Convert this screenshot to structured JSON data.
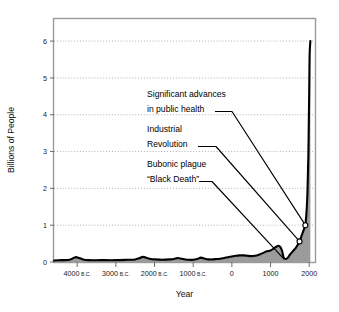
{
  "chart_data": {
    "type": "area",
    "title": "",
    "xlabel": "Year",
    "ylabel": "Billions of People",
    "xlim": [
      -4600,
      2150
    ],
    "ylim": [
      0,
      6.6
    ],
    "grid": true,
    "legend": "none",
    "x_tick_values": [
      -4000,
      -3000,
      -2000,
      -1000,
      0,
      1000,
      2000
    ],
    "x_tick_labels": [
      "4000 B.C.",
      "3000 B.C.",
      "2000 B.C.",
      "1000 B.C.",
      "0",
      "1000",
      "2000"
    ],
    "x_tick_numbers": [
      "4000",
      "3000",
      "2000",
      "1000",
      "0",
      "1000",
      "2000"
    ],
    "x_tick_eras": [
      "B.C.",
      "B.C.",
      "B.C.",
      "B.C.",
      "",
      "",
      ""
    ],
    "y_tick_values": [
      0,
      1,
      2,
      3,
      4,
      5,
      6
    ],
    "y_tick_labels": [
      "0",
      "1",
      "2",
      "3",
      "4",
      "5",
      "6"
    ],
    "series": [
      {
        "name": "World population",
        "x": [
          -4600,
          -4400,
          -4200,
          -4050,
          -3950,
          -3850,
          -3700,
          -3400,
          -3000,
          -2700,
          -2500,
          -2400,
          -2300,
          -2200,
          -2100,
          -2000,
          -1800,
          -1600,
          -1500,
          -1400,
          -1300,
          -1200,
          -1100,
          -1000,
          -900,
          -800,
          -700,
          -600,
          -500,
          -400,
          -300,
          -200,
          -100,
          0,
          100,
          200,
          300,
          400,
          500,
          600,
          700,
          800,
          900,
          1000,
          1100,
          1200,
          1250,
          1300,
          1340,
          1400,
          1450,
          1500,
          1550,
          1600,
          1650,
          1700,
          1750,
          1800,
          1850,
          1900,
          1930,
          1950,
          1960,
          1970,
          1975,
          1980,
          1990,
          2000,
          2010,
          2030
        ],
        "y": [
          0.04,
          0.05,
          0.06,
          0.13,
          0.11,
          0.07,
          0.05,
          0.05,
          0.05,
          0.06,
          0.07,
          0.1,
          0.14,
          0.11,
          0.08,
          0.07,
          0.06,
          0.07,
          0.08,
          0.11,
          0.09,
          0.07,
          0.06,
          0.06,
          0.08,
          0.12,
          0.09,
          0.07,
          0.07,
          0.08,
          0.09,
          0.11,
          0.13,
          0.15,
          0.17,
          0.18,
          0.18,
          0.17,
          0.16,
          0.17,
          0.2,
          0.24,
          0.29,
          0.31,
          0.38,
          0.44,
          0.41,
          0.3,
          0.12,
          0.08,
          0.12,
          0.2,
          0.26,
          0.32,
          0.38,
          0.46,
          0.56,
          0.7,
          0.85,
          1.0,
          1.35,
          1.75,
          2.1,
          2.55,
          2.75,
          3.0,
          3.8,
          4.6,
          5.6,
          6.0
        ]
      }
    ],
    "markers": [
      {
        "x": 1750,
        "y": 0.56,
        "label": "Industrial Revolution marker"
      },
      {
        "x": 1900,
        "y": 1.0,
        "label": "Significant advances in public health marker"
      }
    ],
    "annotations": [
      {
        "id": "public-health",
        "lines": [
          "Significant advances",
          "in public health"
        ],
        "target_x": 1900,
        "target_y": 1.0
      },
      {
        "id": "industrial-revolution",
        "lines": [
          "Industrial",
          "Revolution"
        ],
        "target_x": 1750,
        "target_y": 0.56
      },
      {
        "id": "bubonic-plague",
        "lines": [
          "Bubonic plague",
          "“Black Death”"
        ],
        "target_x": 1350,
        "target_y": 0.08
      }
    ],
    "colors": {
      "area_fill": "#9b9b9b",
      "line": "#000000",
      "frame": "#9a9a9a",
      "grid": "#9e9e9e",
      "text": "#1a1a1a",
      "background": "#ffffff"
    }
  }
}
